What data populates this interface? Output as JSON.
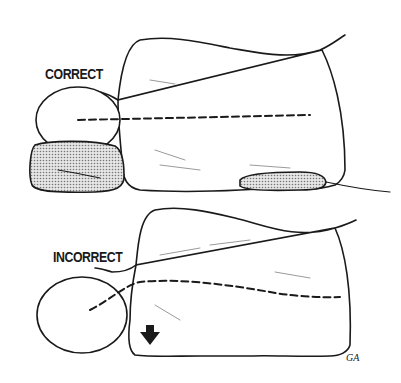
{
  "figure": {
    "type": "illustration",
    "panels": [
      {
        "label": "CORRECT",
        "description": "head supported by pillow, spine line straight",
        "pillow": true,
        "arrow": false
      },
      {
        "label": "INCORRECT",
        "description": "no pillow, head drops, spine line curves down at neck",
        "pillow": false,
        "arrow": true
      }
    ],
    "signature": "GA",
    "colors": {
      "ink": "#1a1a1a",
      "background": "#ffffff",
      "pillow_fill": "#c8c8c8"
    }
  }
}
